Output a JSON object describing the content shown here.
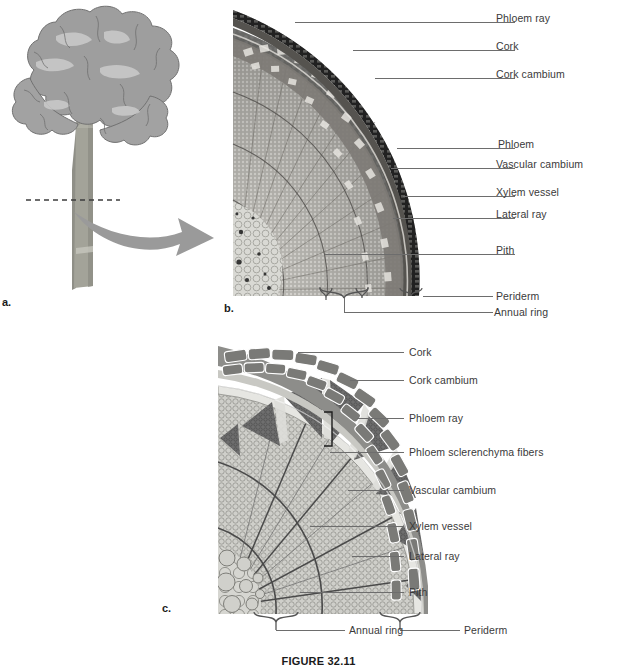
{
  "figure": {
    "caption": "FIGURE 32.11",
    "panels": [
      {
        "letter": "a.",
        "name": "tree-habit-illustration"
      },
      {
        "letter": "b.",
        "name": "woody-stem-micrograph"
      },
      {
        "letter": "c.",
        "name": "woody-stem-diagram"
      }
    ]
  },
  "panel_a": {
    "letter": "a.",
    "description": "tree with dashed cross-section cut line through trunk",
    "cut_line": "dashed",
    "arrow": "curved-arrow-right",
    "colors": {
      "canopy": "#9b9b9b",
      "canopy_highlight": "#c9c9c9",
      "trunk": "#9a9a92",
      "arrow": "#9a9a9a",
      "outline": "#6f6f6f"
    }
  },
  "panel_b": {
    "letter": "b.",
    "labels": [
      {
        "text": "Phloem ray",
        "name": "label-phloem-ray"
      },
      {
        "text": "Cork",
        "name": "label-cork"
      },
      {
        "text": "Cork cambium",
        "name": "label-cork-cambium"
      },
      {
        "text": "Phloem",
        "name": "label-phloem"
      },
      {
        "text": "Vascular cambium",
        "name": "label-vascular-cambium"
      },
      {
        "text": "Xylem vessel",
        "name": "label-xylem-vessel"
      },
      {
        "text": "Lateral ray",
        "name": "label-lateral-ray"
      },
      {
        "text": "Pith",
        "name": "label-pith"
      },
      {
        "text": "Periderm",
        "name": "label-periderm"
      },
      {
        "text": "Annual ring",
        "name": "label-annual-ring"
      }
    ]
  },
  "panel_c": {
    "letter": "c.",
    "labels": [
      {
        "text": "Cork",
        "name": "label-cork"
      },
      {
        "text": "Cork cambium",
        "name": "label-cork-cambium"
      },
      {
        "text": "Phloem ray",
        "name": "label-phloem-ray"
      },
      {
        "text": "Phloem sclerenchyma fibers",
        "name": "label-phloem-sclerenchyma-fibers"
      },
      {
        "text": "Vascular cambium",
        "name": "label-vascular-cambium"
      },
      {
        "text": "Xylem vessel",
        "name": "label-xylem-vessel"
      },
      {
        "text": "Lateral ray",
        "name": "label-lateral-ray"
      },
      {
        "text": "Pith",
        "name": "label-pith"
      },
      {
        "text": "Annual ring",
        "name": "label-annual-ring"
      },
      {
        "text": "Periderm",
        "name": "label-periderm"
      }
    ],
    "colors": {
      "cork": "#8c8c8c",
      "cork_light": "#b4b4b4",
      "fibers": "#6e6e6e",
      "xylem": "#cfcfcc",
      "pith": "#d3d3cf",
      "ray_line": "#5a5a5a"
    }
  }
}
